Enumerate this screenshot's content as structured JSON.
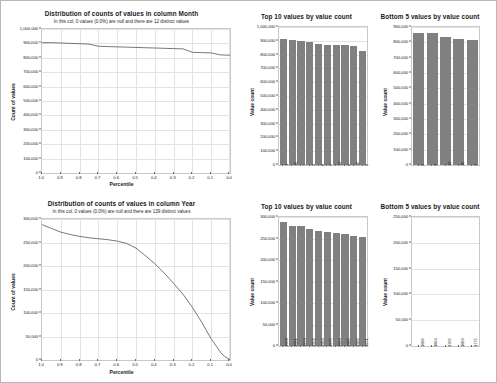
{
  "page": {
    "background_color": "#ffffff",
    "border_color": "#b8b8b8",
    "bar_color": "#808080",
    "grid_color": "#e3e3e3"
  },
  "panels": {
    "month_distribution": {
      "title": "Distribution of counts of values in column Month",
      "subtitle": "In this col, 0 values (0.0%) are null and there are 12 distinct values",
      "ylabel": "Count of values",
      "xlabel": "Percentile",
      "yticks": [
        "0",
        "100,000",
        "200,000",
        "300,000",
        "400,000",
        "500,000",
        "600,000",
        "700,000",
        "800,000",
        "900,000",
        "1,000,000"
      ],
      "xticks": [
        "1.0",
        "0.9",
        "0.8",
        "0.7",
        "0.6",
        "0.5",
        "0.4",
        "0.3",
        "0.2",
        "0.1",
        "0.0"
      ]
    },
    "month_top10": {
      "title": "Top 10 values by value count",
      "ylabel": "Value count",
      "yticks": [
        "0",
        "100,000",
        "200,000",
        "300,000",
        "400,000",
        "500,000",
        "600,000",
        "700,000",
        "800,000",
        "900,000",
        "1,000,000"
      ],
      "xticks": [
        "1",
        "10",
        "7",
        "3",
        "8",
        "5",
        "12",
        "4",
        "11",
        "2"
      ]
    },
    "month_bottom5": {
      "title": "Bottom 5 values by value count",
      "ylabel": "Value count",
      "yticks": [
        "0",
        "100,000",
        "200,000",
        "300,000",
        "400,000",
        "500,000",
        "600,000",
        "700,000",
        "800,000",
        "900,000"
      ],
      "xticks": [
        "6",
        "9",
        "12",
        "11",
        "2"
      ]
    },
    "year_distribution": {
      "title": "Distribution of counts of values in column Year",
      "subtitle": "In this col, 0 values (0.0%) are null and there are 139 distinct values",
      "ylabel": "Count of values",
      "xlabel": "Percentile",
      "yticks": [
        "0",
        "50,000",
        "100,000",
        "150,000",
        "200,000",
        "250,000",
        "300,000"
      ],
      "xticks": [
        "1.0",
        "0.9",
        "0.8",
        "0.7",
        "0.6",
        "0.5",
        "0.4",
        "0.3",
        "0.2",
        "0.1",
        "0.0"
      ]
    },
    "year_top10": {
      "title": "Top 10 values by value count",
      "ylabel": "Value count",
      "yticks": [
        "0",
        "50,000",
        "100,000",
        "150,000",
        "200,000",
        "250,000",
        "300,000"
      ],
      "xticks": [
        "1968",
        "1981",
        "1973",
        "1952",
        "1983",
        "1975",
        "1964",
        "1985",
        "1966",
        "1971"
      ]
    },
    "year_bottom5": {
      "title": "Bottom 5 values by value count",
      "ylabel": "Value count",
      "yticks": [
        "0",
        "50,000",
        "100,000",
        "150,000",
        "200,000",
        "250,000"
      ],
      "xticks": [
        "1686",
        "1804",
        "1706",
        "1869",
        "1775"
      ]
    }
  },
  "chart_data": [
    {
      "id": "month_distribution",
      "type": "line",
      "title": "Distribution of counts of values in column Month",
      "subtitle": "In this col, 0 values (0.0%) are null and there are 12 distinct values",
      "xlabel": "Percentile",
      "ylabel": "Count of values",
      "xlim": [
        1.0,
        0.0
      ],
      "ylim": [
        0,
        1000000
      ],
      "x_descending": true,
      "grid": true,
      "x": [
        1.0,
        0.95,
        0.9,
        0.85,
        0.8,
        0.75,
        0.7,
        0.65,
        0.6,
        0.55,
        0.5,
        0.45,
        0.4,
        0.35,
        0.3,
        0.25,
        0.2,
        0.15,
        0.1,
        0.05,
        0.0
      ],
      "y": [
        905000,
        905000,
        903000,
        900000,
        898000,
        895000,
        880000,
        878000,
        876000,
        874000,
        872000,
        870000,
        868000,
        866000,
        864000,
        862000,
        838000,
        836000,
        834000,
        820000,
        818000
      ]
    },
    {
      "id": "month_top10",
      "type": "bar",
      "title": "Top 10 values by value count",
      "ylabel": "Value count",
      "ylim": [
        0,
        1000000
      ],
      "categories": [
        "1",
        "10",
        "7",
        "3",
        "8",
        "5",
        "12",
        "4",
        "11",
        "2"
      ],
      "values": [
        910000,
        903000,
        898000,
        888000,
        875000,
        872000,
        870000,
        868000,
        862000,
        825000
      ]
    },
    {
      "id": "month_bottom5",
      "type": "bar",
      "title": "Bottom 5 values by value count",
      "ylabel": "Value count",
      "ylim": [
        0,
        900000
      ],
      "categories": [
        "6",
        "9",
        "12",
        "11",
        "2"
      ],
      "values": [
        860000,
        858000,
        838000,
        820000,
        818000
      ]
    },
    {
      "id": "year_distribution",
      "type": "line",
      "title": "Distribution of counts of values in column Year",
      "subtitle": "In this col, 0 values (0.0%) are null and there are 139 distinct values",
      "xlabel": "Percentile",
      "ylabel": "Count of values",
      "xlim": [
        1.0,
        0.0
      ],
      "ylim": [
        0,
        300000
      ],
      "x_descending": true,
      "grid": true,
      "x": [
        1.0,
        0.95,
        0.9,
        0.85,
        0.8,
        0.75,
        0.7,
        0.65,
        0.6,
        0.55,
        0.5,
        0.45,
        0.4,
        0.35,
        0.3,
        0.25,
        0.2,
        0.15,
        0.1,
        0.07,
        0.05,
        0.03,
        0.01,
        0.0
      ],
      "y": [
        288000,
        280000,
        272000,
        267000,
        263000,
        260000,
        258000,
        256000,
        253000,
        248000,
        238000,
        222000,
        205000,
        185000,
        163000,
        140000,
        112000,
        80000,
        45000,
        28000,
        16000,
        8000,
        3000,
        1000
      ]
    },
    {
      "id": "year_top10",
      "type": "bar",
      "title": "Top 10 values by value count",
      "ylabel": "Value count",
      "ylim": [
        0,
        300000
      ],
      "categories": [
        "1968",
        "1981",
        "1973",
        "1952",
        "1983",
        "1975",
        "1964",
        "1985",
        "1966",
        "1971"
      ],
      "values": [
        288000,
        278000,
        278000,
        272000,
        267000,
        265000,
        263000,
        260000,
        256000,
        253000
      ]
    },
    {
      "id": "year_bottom5",
      "type": "bar",
      "title": "Bottom 5 values by value count",
      "ylabel": "Value count",
      "ylim": [
        0,
        250000
      ],
      "categories": [
        "1686",
        "1804",
        "1706",
        "1869",
        "1775"
      ],
      "values": [
        60,
        50,
        40,
        30,
        20
      ]
    }
  ]
}
